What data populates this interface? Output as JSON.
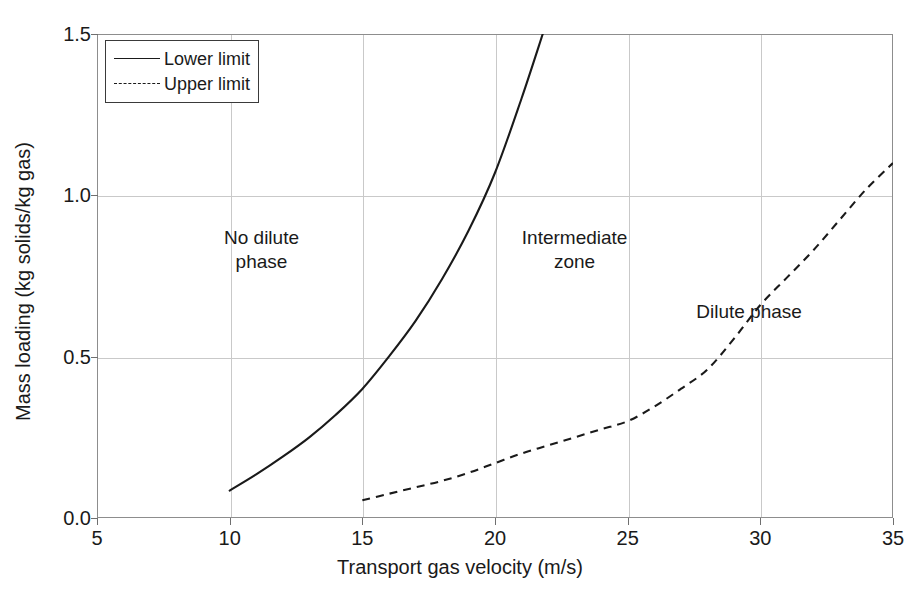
{
  "chart_data": {
    "type": "line",
    "title": "",
    "xlabel": "Transport gas velocity (m/s)",
    "ylabel": "Mass loading (kg solids/kg gas)",
    "xlim": [
      5,
      35
    ],
    "ylim": [
      0.0,
      1.5
    ],
    "xticks": [
      5,
      10,
      15,
      20,
      25,
      30,
      35
    ],
    "xtick_labels": [
      "5",
      "10",
      "15",
      "20",
      "25",
      "30",
      "35"
    ],
    "yticks": [
      0.0,
      0.5,
      1.0,
      1.5
    ],
    "ytick_labels": [
      "0.0",
      "0.5",
      "1.0",
      "1.5"
    ],
    "grid": true,
    "legend_position": "top-left",
    "series": [
      {
        "name": "Lower limit",
        "style": "solid",
        "color": "#1a1a1a",
        "x": [
          10.0,
          11.0,
          12.0,
          13.0,
          14.0,
          15.0,
          16.0,
          17.0,
          18.0,
          19.0,
          20.0,
          21.0,
          21.8
        ],
        "y": [
          0.085,
          0.135,
          0.19,
          0.25,
          0.32,
          0.4,
          0.5,
          0.61,
          0.74,
          0.89,
          1.07,
          1.3,
          1.5
        ]
      },
      {
        "name": "Upper limit",
        "style": "dashed",
        "color": "#1a1a1a",
        "x": [
          15.0,
          16.0,
          17.0,
          18.0,
          19.0,
          20.0,
          21.0,
          22.0,
          23.0,
          24.0,
          25.0,
          26.0,
          27.0,
          28.0,
          29.0,
          30.0,
          31.0,
          32.0,
          33.0,
          34.0,
          35.0
        ],
        "y": [
          0.055,
          0.075,
          0.095,
          0.115,
          0.14,
          0.17,
          0.2,
          0.225,
          0.25,
          0.275,
          0.3,
          0.345,
          0.4,
          0.46,
          0.555,
          0.66,
          0.745,
          0.83,
          0.925,
          1.02,
          1.1
        ]
      }
    ],
    "annotations": [
      {
        "text": "No dilute\nphase",
        "x": 11.2,
        "y": 0.83
      },
      {
        "text": "Intermediate\nzone",
        "x": 23.0,
        "y": 0.83
      },
      {
        "text": "Dilute phase",
        "x": 30.6,
        "y": 0.6
      }
    ]
  },
  "legend": {
    "items": [
      {
        "label": "Lower limit",
        "style": "solid"
      },
      {
        "label": "Upper limit",
        "style": "dashed"
      }
    ]
  },
  "axes": {
    "x_title": "Transport gas velocity (m/s)",
    "y_title": "Mass loading (kg solids/kg gas)"
  },
  "page_artifact": ""
}
